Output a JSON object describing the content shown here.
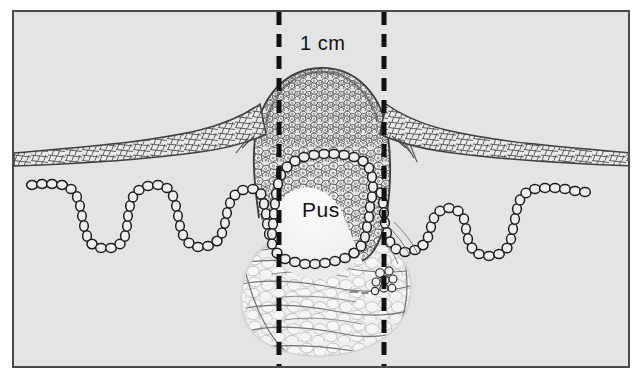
{
  "figure": {
    "kind": "histology-cross-section",
    "panel": {
      "background_color": "#e4e4e4",
      "border_color": "#4a4a4a",
      "outer_background_color": "#ffffff"
    },
    "labels": [
      {
        "name": "scale-label",
        "text": "1 cm",
        "x": 286,
        "y": 20
      },
      {
        "name": "pus-label",
        "text": "Pus",
        "x": 288,
        "y": 186
      }
    ],
    "scale_bar": {
      "text": "1 cm",
      "style": "dashed",
      "color": "#111111",
      "left_line_x": 265,
      "right_line_x": 370,
      "top_y": 0,
      "bottom_y": 356,
      "dash_length": 13,
      "dash_gap": 9,
      "stroke_width": 5
    },
    "structures": [
      {
        "name": "epidermis-layer",
        "label": "Epidermis",
        "pattern": "elongated-mesh-cells",
        "stroke": "#3c3c3c"
      },
      {
        "name": "inflammatory-mass",
        "label": "Inflammatory cell mass",
        "pattern": "dense-polygonal-cells",
        "stroke": "#3f3f3f"
      },
      {
        "name": "pus-cavity",
        "label": "Pus",
        "fill": "#f2f2f2",
        "stroke": "#1a1a1a"
      },
      {
        "name": "basal-cell-chain",
        "label": "Beaded basal layer",
        "pattern": "bead-chain",
        "stroke": "#1f1f1f"
      },
      {
        "name": "subcutaneous-fat",
        "label": "Subcutaneous fat",
        "pattern": "lobular-fat",
        "fill": "#f4f4f4",
        "stroke": "#6f6f6f"
      },
      {
        "name": "micro-abscess-cluster",
        "label": "Micro-abscess cell cluster",
        "stroke": "#2a2a2a"
      }
    ]
  }
}
